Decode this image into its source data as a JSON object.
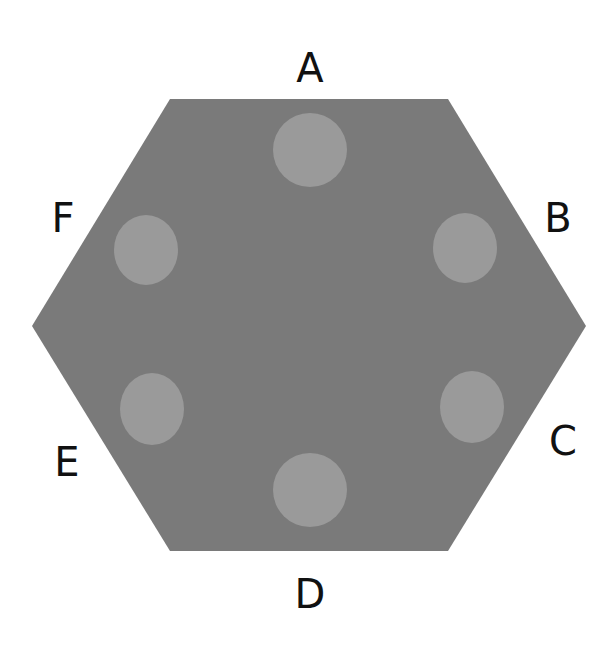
{
  "diagram": {
    "shape": "hexagon",
    "hexagon_color": "#7a7a7a",
    "spot_color": "#9a9a9a",
    "label_color": "#111111",
    "hexagon_points": "170,99 448,99 586,326 448,551 170,551 32,326",
    "spots": [
      {
        "id": "A",
        "cx": 310,
        "cy": 150,
        "rx": 37,
        "ry": 37
      },
      {
        "id": "B",
        "cx": 465,
        "cy": 248,
        "rx": 32,
        "ry": 35
      },
      {
        "id": "C",
        "cx": 472,
        "cy": 407,
        "rx": 32,
        "ry": 36
      },
      {
        "id": "D",
        "cx": 310,
        "cy": 490,
        "rx": 37,
        "ry": 37
      },
      {
        "id": "E",
        "cx": 152,
        "cy": 409,
        "rx": 32,
        "ry": 36
      },
      {
        "id": "F",
        "cx": 146,
        "cy": 250,
        "rx": 32,
        "ry": 35
      }
    ],
    "labels": [
      {
        "text": "A",
        "x": 310,
        "y": 82
      },
      {
        "text": "B",
        "x": 558,
        "y": 232
      },
      {
        "text": "C",
        "x": 563,
        "y": 455
      },
      {
        "text": "D",
        "x": 310,
        "y": 608
      },
      {
        "text": "E",
        "x": 67,
        "y": 476
      },
      {
        "text": "F",
        "x": 63,
        "y": 232
      }
    ]
  }
}
